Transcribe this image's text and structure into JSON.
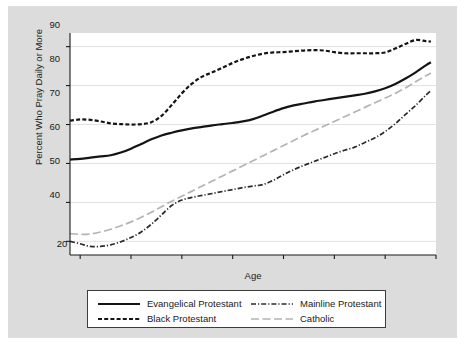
{
  "chart_data": {
    "type": "line",
    "title": "",
    "xlabel": "Age",
    "ylabel": "Percent Who Pray Daily or More",
    "xlim": [
      18,
      90
    ],
    "ylim": [
      36.5,
      93.5
    ],
    "xticks": [
      20,
      30,
      40,
      50,
      60,
      70,
      80,
      90
    ],
    "yticks": [
      40,
      50,
      60,
      70,
      80,
      90
    ],
    "grid": "horizontal",
    "legend_position": "below-axes",
    "x": [
      18,
      20,
      22,
      24,
      26,
      28,
      30,
      32,
      34,
      36,
      38,
      40,
      42,
      44,
      46,
      48,
      50,
      52,
      54,
      56,
      58,
      60,
      62,
      64,
      66,
      68,
      70,
      72,
      74,
      76,
      78,
      80,
      82,
      84,
      86,
      88,
      89
    ],
    "series": [
      {
        "name": "Evangelical Protestant",
        "style": "solid",
        "color": "#141414",
        "values": [
          61.0,
          61.2,
          61.5,
          61.8,
          62.1,
          62.8,
          63.8,
          65.0,
          66.2,
          67.2,
          67.9,
          68.5,
          69.0,
          69.4,
          69.8,
          70.1,
          70.4,
          70.8,
          71.4,
          72.3,
          73.3,
          74.2,
          74.9,
          75.4,
          75.9,
          76.3,
          76.7,
          77.1,
          77.5,
          77.9,
          78.5,
          79.3,
          80.4,
          81.8,
          83.4,
          85.2,
          86.0
        ]
      },
      {
        "name": "Black Protestant",
        "style": "dashed",
        "color": "#141414",
        "values": [
          71.0,
          71.3,
          71.2,
          70.8,
          70.3,
          70.1,
          70.0,
          70.1,
          70.6,
          72.2,
          75.0,
          78.0,
          80.5,
          82.3,
          83.4,
          84.6,
          85.8,
          86.8,
          87.6,
          88.2,
          88.5,
          88.6,
          88.8,
          89.0,
          89.1,
          89.0,
          88.6,
          88.3,
          88.3,
          88.3,
          88.3,
          88.5,
          89.5,
          90.7,
          91.7,
          91.4,
          91.3
        ]
      },
      {
        "name": "Mainline Protestant",
        "style": "dashdot",
        "color": "#2b2b2b",
        "values": [
          40.0,
          39.4,
          38.7,
          38.7,
          39.1,
          39.9,
          41.0,
          42.4,
          44.4,
          46.8,
          49.2,
          50.6,
          51.3,
          51.8,
          52.3,
          52.8,
          53.3,
          53.8,
          54.2,
          54.6,
          55.7,
          57.1,
          58.4,
          59.5,
          60.5,
          61.5,
          62.5,
          63.4,
          64.2,
          65.4,
          66.6,
          68.2,
          70.2,
          72.6,
          74.9,
          77.5,
          78.7
        ]
      },
      {
        "name": "Catholic",
        "style": "longdash",
        "color": "#b4b4b4",
        "values": [
          42.0,
          41.8,
          41.9,
          42.4,
          43.1,
          44.0,
          45.0,
          46.2,
          47.5,
          48.9,
          50.3,
          51.6,
          52.9,
          54.2,
          55.5,
          56.8,
          58.1,
          59.4,
          60.7,
          62.0,
          63.3,
          64.6,
          65.9,
          67.2,
          68.4,
          69.6,
          70.8,
          72.0,
          73.2,
          74.4,
          75.6,
          76.8,
          78.0,
          79.4,
          81.0,
          82.5,
          83.2
        ]
      }
    ]
  },
  "axes": {
    "xlabel": "Age",
    "ylabel": "Percent Who Pray Daily or More",
    "xticks": [
      "20",
      "30",
      "40",
      "50",
      "60",
      "70",
      "80",
      "90"
    ],
    "yticks": [
      "90",
      "80",
      "70",
      "60",
      "50",
      "40"
    ]
  },
  "legend": {
    "entries": [
      {
        "label": "Evangelical Protestant"
      },
      {
        "label": "Black Protestant"
      },
      {
        "label": "Mainline Protestant"
      },
      {
        "label": "Catholic"
      }
    ]
  },
  "colors": {
    "background": "#dcdcdc",
    "plot_background": "#ffffff",
    "axis": "#1a1a1a",
    "grid": "#e2e2e2",
    "dark_series": "#141414",
    "light_series": "#b4b4b4"
  }
}
